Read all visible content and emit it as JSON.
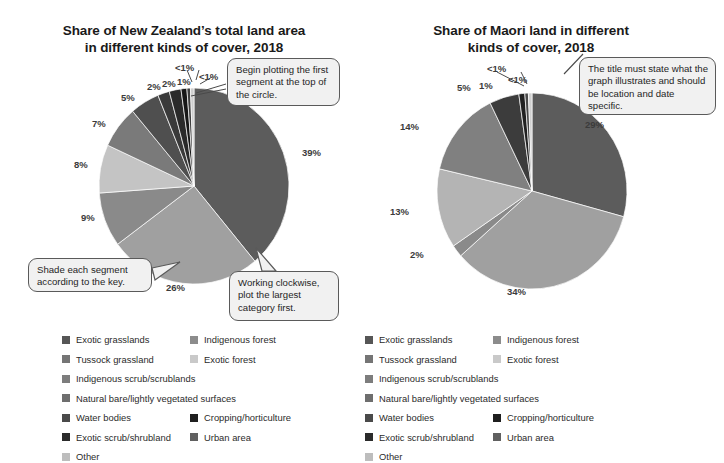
{
  "charts": [
    {
      "id": "nz-total-land",
      "title": "Share of New Zealand’s total land area\nin different kinds of cover, 2018",
      "title_line1": "Share of New Zealand’s total land area",
      "title_line2": "in different kinds of cover, 2018"
    },
    {
      "id": "maori-land",
      "title": "Share of Maori land in different\nkinds of cover, 2018",
      "title_line1": "Share of Maori land in different",
      "title_line2": "kinds of cover, 2018"
    }
  ],
  "callouts": {
    "begin_plotting": "Begin plotting the first segment at the top of the circle.",
    "shade_segment": "Shade each segment according to the key.",
    "working_clockwise": "Working clockwise, plot the largest category first.",
    "title_must_state": "The title must state what the graph illustrates and should be location and date specific."
  },
  "legend": {
    "rows": [
      [
        {
          "label": "Exotic grasslands",
          "color": "#565656"
        },
        {
          "label": "Indigenous forest",
          "color": "#8c8c8c"
        }
      ],
      [
        {
          "label": "Tussock grassland",
          "color": "#757575"
        },
        {
          "label": "Exotic forest",
          "color": "#c9c9c9"
        }
      ],
      [
        {
          "label": "Indigenous scrub/scrublands",
          "color": "#7d7d7d"
        }
      ],
      [
        {
          "label": "Natural bare/lightly vegetated surfaces",
          "color": "#6e6e6e"
        }
      ],
      [
        {
          "label": "Water bodies",
          "color": "#4a4a4a"
        },
        {
          "label": "Cropping/horticulture",
          "color": "#1f1f1f"
        }
      ],
      [
        {
          "label": "Exotic scrub/shrubland",
          "color": "#2b2b2b"
        },
        {
          "label": "Urban area",
          "color": "#606060"
        }
      ],
      [
        {
          "label": "Other",
          "color": "#bdbdbd"
        }
      ]
    ]
  },
  "chart_data": [
    {
      "type": "pie",
      "title": "Share of New Zealand’s total land area in different kinds of cover, 2018",
      "start_angle_deg": 0,
      "direction": "clockwise",
      "legend_position": "bottom",
      "categories": [
        "Exotic grasslands",
        "Tussock grassland",
        "Indigenous scrub/scrublands",
        "Natural bare/lightly vegetated surfaces",
        "Water bodies",
        "Exotic scrub/shrubland",
        "Other",
        "Indigenous forest",
        "Exotic forest",
        "Cropping/horticulture",
        "Urban area"
      ],
      "values": [
        39,
        26,
        9,
        8,
        7,
        5,
        2,
        2,
        1,
        0.6,
        0.6
      ],
      "labels": [
        "39%",
        "26%",
        "9%",
        "8%",
        "7%",
        "5%",
        "2%",
        "2%",
        "1%",
        "<1%",
        "<1%"
      ],
      "colors": [
        "#5c5c5c",
        "#a0a0a0",
        "#8a8a8a",
        "#c4c4c4",
        "#7a7a7a",
        "#4f4f4f",
        "#3a3a3a",
        "#2a2a2a",
        "#171717",
        "#3f3f3f",
        "#cfcfcf"
      ]
    },
    {
      "type": "pie",
      "title": "Share of Maori land in different kinds of cover, 2018",
      "start_angle_deg": 0,
      "direction": "clockwise",
      "legend_position": "bottom",
      "categories": [
        "Exotic grasslands",
        "Tussock grassland",
        "Indigenous scrub/scrublands",
        "Natural bare/lightly vegetated surfaces",
        "Water bodies",
        "Exotic scrub/shrubland",
        "Other",
        "Indigenous forest",
        "Exotic forest"
      ],
      "values": [
        29,
        34,
        2,
        13,
        14,
        5,
        1,
        0.6,
        0.6
      ],
      "labels": [
        "29%",
        "34%",
        "2%",
        "13%",
        "14%",
        "5%",
        "1%",
        "<1%",
        "<1%"
      ],
      "colors": [
        "#5c5c5c",
        "#a0a0a0",
        "#8a8a8a",
        "#b4b4b4",
        "#808080",
        "#3c3c3c",
        "#212121",
        "#4a4a4a",
        "#cfcfcf"
      ]
    }
  ],
  "pct_labels_left": [
    {
      "text": "39%",
      "x": 302,
      "y": 148
    },
    {
      "text": "26%",
      "x": 166,
      "y": 283
    },
    {
      "text": "9%",
      "x": 81,
      "y": 213
    },
    {
      "text": "8%",
      "x": 74,
      "y": 160
    },
    {
      "text": "7%",
      "x": 92,
      "y": 119
    },
    {
      "text": "5%",
      "x": 121,
      "y": 93
    },
    {
      "text": "2%",
      "x": 147,
      "y": 82
    },
    {
      "text": "2%",
      "x": 162,
      "y": 79
    },
    {
      "text": "1%",
      "x": 177,
      "y": 77
    },
    {
      "text": "<1%",
      "x": 175,
      "y": 63
    },
    {
      "text": "<1%",
      "x": 199,
      "y": 72
    }
  ],
  "pct_labels_right": [
    {
      "text": "29%",
      "x": 585,
      "y": 120
    },
    {
      "text": "34%",
      "x": 507,
      "y": 287
    },
    {
      "text": "2%",
      "x": 410,
      "y": 250
    },
    {
      "text": "13%",
      "x": 390,
      "y": 207
    },
    {
      "text": "14%",
      "x": 400,
      "y": 122
    },
    {
      "text": "5%",
      "x": 457,
      "y": 83
    },
    {
      "text": "1%",
      "x": 479,
      "y": 81
    },
    {
      "text": "<1%",
      "x": 487,
      "y": 64
    },
    {
      "text": "<1%",
      "x": 508,
      "y": 75
    }
  ]
}
